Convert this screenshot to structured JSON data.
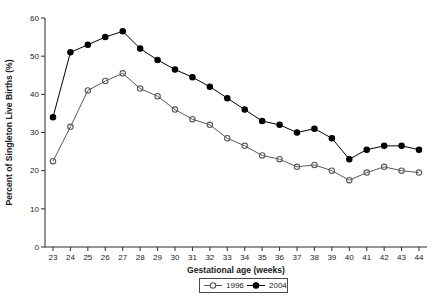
{
  "chart_data": {
    "type": "line",
    "title": "",
    "xlabel": "Gestational age (weeks)",
    "ylabel": "Percent of Singleton Live Births (%)",
    "x": [
      23,
      24,
      25,
      26,
      27,
      28,
      29,
      30,
      31,
      32,
      33,
      34,
      35,
      36,
      37,
      38,
      39,
      40,
      41,
      42,
      43,
      44
    ],
    "xlim": [
      23,
      44
    ],
    "ylim": [
      0,
      60
    ],
    "yticks": [
      0,
      10,
      20,
      30,
      40,
      50,
      60
    ],
    "grid": false,
    "legend_position": "bottom-center",
    "series": [
      {
        "name": "1996",
        "marker": "open-circle",
        "color": "#595959",
        "values": [
          22.5,
          31.5,
          41,
          43.5,
          45.5,
          41.5,
          39.5,
          36,
          33.5,
          32,
          28.5,
          26.5,
          24,
          23,
          21,
          21.5,
          20,
          17.5,
          19.5,
          21,
          20,
          19.5
        ]
      },
      {
        "name": "2004",
        "marker": "filled-circle",
        "color": "#000000",
        "values": [
          34,
          51,
          53,
          55,
          56.5,
          52,
          49,
          46.5,
          44.5,
          42,
          39,
          36,
          33,
          32,
          30,
          31,
          28.5,
          23,
          25.5,
          26.5,
          26.5,
          25.5
        ]
      }
    ],
    "axis_color": "#2b2b2b",
    "text_color": "#1a1a1a",
    "legend_entries": [
      "1996",
      "2004"
    ]
  }
}
